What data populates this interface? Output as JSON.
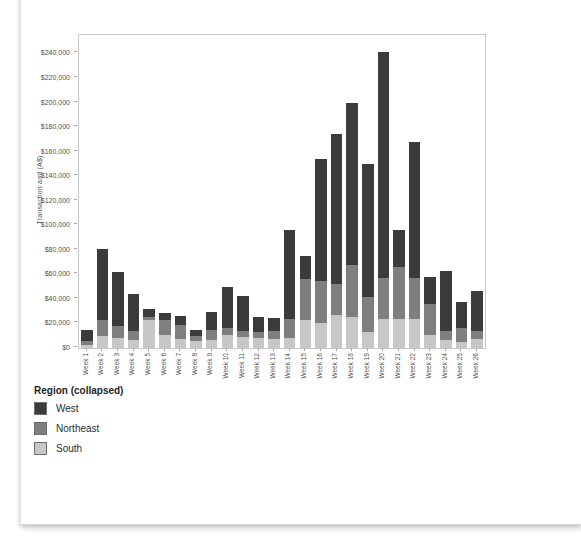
{
  "chart_data": {
    "type": "bar",
    "stacked": true,
    "title": "",
    "xlabel": "",
    "ylabel": "Transaction amt (A$)",
    "ylim": [
      0,
      255000
    ],
    "grid": false,
    "legend_position": "bottom-left",
    "categories": [
      "Week 1",
      "Week 2",
      "Week 3",
      "Week 4",
      "Week 5",
      "Week 6",
      "Week 7",
      "Week 8",
      "Week 9",
      "Week 10",
      "Week 11",
      "Week 12",
      "Week 13",
      "Week 14",
      "Week 15",
      "Week 16",
      "Week 17",
      "Week 18",
      "Week 19",
      "Week 20",
      "Week 21",
      "Week 22",
      "Week 23",
      "Week 24",
      "Week 25",
      "Week 26"
    ],
    "series": [
      {
        "name": "South",
        "color": "#c7c7c7",
        "values": [
          2500,
          9500,
          8500,
          6500,
          22500,
          10500,
          7500,
          6000,
          6500,
          10500,
          9000,
          8000,
          7500,
          8000,
          23000,
          20000,
          26500,
          25500,
          13000,
          24000,
          24000,
          24000,
          10500,
          6500,
          5000,
          7000
        ]
      },
      {
        "name": "Northeast",
        "color": "#7f7f7f",
        "values": [
          3000,
          13500,
          9500,
          7000,
          3000,
          12000,
          11500,
          3500,
          8000,
          5500,
          4500,
          5000,
          6000,
          16000,
          33500,
          34500,
          26000,
          42500,
          28500,
          33000,
          42000,
          33000,
          25000,
          7000,
          11500,
          6500
        ]
      },
      {
        "name": "West",
        "color": "#3b3b3b",
        "values": [
          9500,
          58000,
          44000,
          30500,
          6500,
          6000,
          7000,
          5000,
          14500,
          34000,
          29000,
          12500,
          11000,
          72500,
          18500,
          99500,
          121500,
          132000,
          108500,
          184000,
          30000,
          111000,
          22000,
          49500,
          21000,
          33000
        ]
      }
    ],
    "yticks": {
      "values": [
        0,
        20000,
        40000,
        60000,
        80000,
        100000,
        120000,
        140000,
        160000,
        180000,
        200000,
        220000,
        240000
      ],
      "labels": [
        "$0",
        "$20,000",
        "$40,000",
        "$60,000",
        "$80,000",
        "$100,000",
        "$120,000",
        "$140,000",
        "$160,000",
        "$180,000",
        "$200,000",
        "$220,000",
        "$240,000"
      ]
    }
  },
  "legend": {
    "title": "Region (collapsed)",
    "items": [
      {
        "label": "West",
        "color": "#3b3b3b"
      },
      {
        "label": "Northeast",
        "color": "#7f7f7f"
      },
      {
        "label": "South",
        "color": "#c7c7c7"
      }
    ]
  }
}
